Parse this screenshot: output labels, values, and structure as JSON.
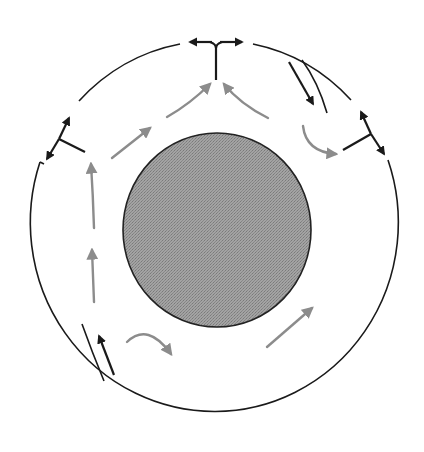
{
  "diagram": {
    "colors": {
      "background": "#ffffff",
      "outline": "#1a1a1a",
      "core_fill": "#9a9a9a",
      "convection_arrow": "#8c8c8c",
      "plate_motion_arrow": "#1a1a1a"
    },
    "outer_boundary": {
      "cx": 216,
      "cy": 233,
      "rx": 184,
      "ry": 189
    },
    "core": {
      "cx": 217,
      "cy": 230,
      "r": 94
    },
    "ridges": [
      {
        "name": "top-ridge",
        "stem": [
          [
            216,
            82
          ],
          [
            216,
            46
          ]
        ],
        "arrows": [
          [
            [
              214,
              42
            ],
            [
              186,
              42
            ]
          ],
          [
            [
              218,
              42
            ],
            [
              246,
              42
            ]
          ]
        ]
      },
      {
        "name": "left-ridge",
        "stem": [
          [
            85,
            152
          ],
          [
            58,
            138
          ]
        ],
        "arrows": [
          [
            [
              60,
              133
            ],
            [
              71,
              113
            ]
          ],
          [
            [
              56,
              142
            ],
            [
              44,
              163
            ]
          ]
        ]
      },
      {
        "name": "right-ridge",
        "stem": [
          [
            343,
            150
          ],
          [
            371,
            135
          ]
        ],
        "arrows": [
          [
            [
              369,
              130
            ],
            [
              359,
              108
            ]
          ],
          [
            [
              374,
              137
            ],
            [
              386,
              157
            ]
          ]
        ]
      }
    ],
    "subduction_zones": [
      {
        "name": "top-right-subduction",
        "slab": [
          [
            302,
            60
          ],
          [
            326,
            113
          ]
        ],
        "arrow": [
          [
            289,
            62
          ],
          [
            316,
            110
          ]
        ]
      },
      {
        "name": "bottom-left-subduction",
        "slab": [
          [
            82,
            324
          ],
          [
            103,
            381
          ]
        ],
        "arrow": [
          [
            114,
            375
          ],
          [
            96,
            330
          ]
        ]
      }
    ],
    "convection_arrows": [
      {
        "name": "convection-arrow-upper-left-1",
        "path": "M112,158 L152,126"
      },
      {
        "name": "convection-arrow-upper-left-2",
        "path": "M167,117 Q190,104 212,82"
      },
      {
        "name": "convection-arrow-upper-right",
        "path": "M268,118 Q240,104 222,82"
      },
      {
        "name": "convection-arrow-right-curve",
        "path": "M303,126 Q308,152 338,154"
      },
      {
        "name": "convection-arrow-left-upper",
        "path": "M94,228 Q93,195 91,162"
      },
      {
        "name": "convection-arrow-left-lower",
        "path": "M94,302 L92,248"
      },
      {
        "name": "convection-arrow-bottom-curve",
        "path": "M127,342 Q148,325 173,356"
      },
      {
        "name": "convection-arrow-bottom-right",
        "path": "M267,347 L314,306"
      }
    ]
  }
}
